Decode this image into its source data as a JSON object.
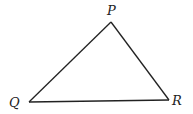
{
  "diagram": {
    "type": "triangle",
    "stroke_color": "#222222",
    "background": "#ffffff",
    "vertices": [
      {
        "name": "P",
        "label": "P",
        "x": 111,
        "y": 22,
        "label_x": 107,
        "label_y": 15
      },
      {
        "name": "Q",
        "label": "Q",
        "x": 29,
        "y": 102,
        "label_x": 9,
        "label_y": 107
      },
      {
        "name": "R",
        "label": "R",
        "x": 169,
        "y": 100,
        "label_x": 172,
        "label_y": 105
      }
    ],
    "edges": [
      {
        "from": "P",
        "to": "Q",
        "label": "PQ"
      },
      {
        "from": "Q",
        "to": "R",
        "label": "QR"
      },
      {
        "from": "R",
        "to": "P",
        "label": "RP"
      }
    ]
  }
}
